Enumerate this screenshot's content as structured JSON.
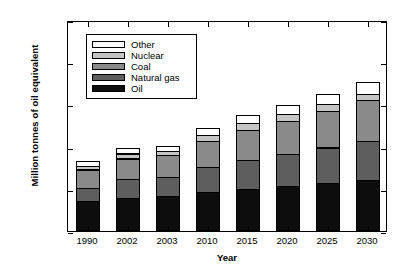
{
  "chart_data": {
    "type": "bar",
    "stacked": true,
    "title": "",
    "xlabel": "Year",
    "ylabel": "Million tonnes of oil equivalent",
    "categories": [
      "1990",
      "2002",
      "2003",
      "2010",
      "2015",
      "2020",
      "2025",
      "2030"
    ],
    "ylim": [
      0,
      25000
    ],
    "yticks": [
      0,
      5000,
      10000,
      15000,
      20000,
      25000
    ],
    "ytick_labels": [
      "0",
      "5000",
      "10 000",
      "15 000",
      "20 000",
      "25 000"
    ],
    "grid": false,
    "legend_position": "upper left",
    "series": [
      {
        "name": "Oil",
        "color": "#0d0d0d",
        "values": [
          3500,
          3950,
          4100,
          4650,
          5000,
          5300,
          5650,
          6050
        ]
      },
      {
        "name": "Natural gas",
        "color": "#5e5e5e",
        "values": [
          1700,
          2300,
          2400,
          3050,
          3550,
          3950,
          4350,
          4700
        ]
      },
      {
        "name": "Coal",
        "color": "#8a8a8a",
        "values": [
          2300,
          2550,
          2700,
          3150,
          3650,
          4000,
          4450,
          4950
        ]
      },
      {
        "name": "Nuclear",
        "color": "#c4c4c4",
        "values": [
          500,
          700,
          600,
          850,
          900,
          950,
          900,
          800
        ]
      },
      {
        "name": "Other",
        "color": "#ffffff",
        "values": [
          700,
          800,
          700,
          900,
          1050,
          1150,
          1300,
          1600
        ]
      }
    ],
    "totals": [
      8700,
      10300,
      10500,
      12600,
      14150,
      15350,
      16650,
      18100
    ],
    "stack_order_top_to_bottom": [
      "Other",
      "Nuclear",
      "Coal",
      "Natural gas",
      "Oil"
    ]
  },
  "legend": {
    "items": [
      {
        "label": "Other",
        "color": "#ffffff"
      },
      {
        "label": "Nuclear",
        "color": "#c4c4c4"
      },
      {
        "label": "Coal",
        "color": "#8a8a8a"
      },
      {
        "label": "Natural gas",
        "color": "#5e5e5e"
      },
      {
        "label": "Oil",
        "color": "#0d0d0d"
      }
    ]
  },
  "axes": {
    "x_title": "Year",
    "y_title": "Million tonnes of oil equivalent"
  }
}
